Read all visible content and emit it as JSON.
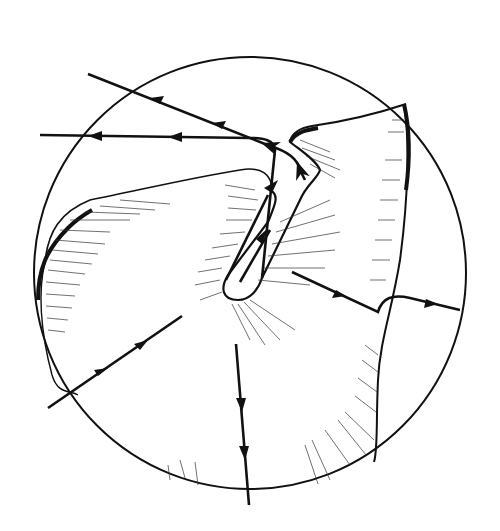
{
  "figure": {
    "type": "line-drawing",
    "colors": {
      "ink": "#111111",
      "background": "#ffffff",
      "hatch": "#333333"
    },
    "circle": {
      "cx": 250,
      "cy": 273,
      "r": 216
    },
    "arrows": [
      {
        "id": "upper-left-1",
        "direction": "left"
      },
      {
        "id": "upper-left-2",
        "direction": "left"
      },
      {
        "id": "groove-up",
        "direction": "up"
      },
      {
        "id": "right-out",
        "direction": "right"
      },
      {
        "id": "lower-left",
        "direction": "down-left"
      },
      {
        "id": "bottom",
        "direction": "down"
      }
    ]
  }
}
